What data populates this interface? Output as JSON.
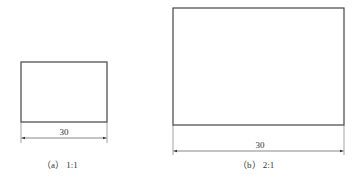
{
  "figures": [
    {
      "id": "a",
      "caption": "（a） 1:1",
      "scale": "1:1",
      "dimension_label": "30",
      "rect": {
        "x": 21,
        "y": 62,
        "w": 86,
        "h": 60
      },
      "dim_line_y": 138
    },
    {
      "id": "b",
      "caption": "（b） 2:1",
      "scale": "2:1",
      "dimension_label": "30",
      "rect": {
        "x": 173,
        "y": 8,
        "w": 171,
        "h": 117
      },
      "dim_line_y": 151
    }
  ],
  "colors": {
    "stroke": "#444444",
    "text": "#333333"
  }
}
